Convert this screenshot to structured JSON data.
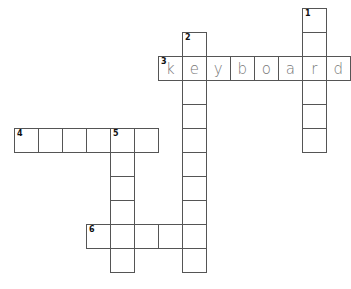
{
  "puzzle": {
    "cell_size": 24,
    "origin": {
      "x": 14,
      "y": 8
    },
    "clues": [
      {
        "number": "1",
        "direction": "down",
        "col": 12,
        "row": 0,
        "length": 6,
        "answer": ""
      },
      {
        "number": "2",
        "direction": "down",
        "col": 7,
        "row": 1,
        "length": 10,
        "answer": ""
      },
      {
        "number": "3",
        "direction": "across",
        "col": 6,
        "row": 2,
        "length": 8,
        "answer": "keyboard"
      },
      {
        "number": "4",
        "direction": "across",
        "col": 0,
        "row": 5,
        "length": 6,
        "answer": ""
      },
      {
        "number": "5",
        "direction": "down",
        "col": 4,
        "row": 5,
        "length": 6,
        "answer": ""
      },
      {
        "number": "6",
        "direction": "across",
        "col": 3,
        "row": 9,
        "length": 5,
        "answer": ""
      }
    ]
  },
  "colors": {
    "border": "#555555",
    "letter": "#777777",
    "number": "#111111"
  }
}
